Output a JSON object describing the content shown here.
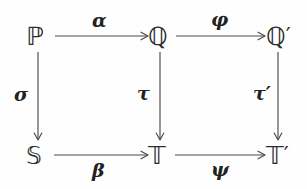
{
  "diagram": {
    "type": "commutative-diagram",
    "grid": {
      "rows": 2,
      "columns": 3
    },
    "background_color": "#fefefe",
    "ink_color": "#2b2b2b",
    "arrow_color": "#4a4a4a",
    "nodes": {
      "top_left": {
        "symbol": "ℙ",
        "prime": "",
        "name": "P",
        "row": 0,
        "col": 0
      },
      "top_middle": {
        "symbol": "ℚ",
        "prime": "",
        "name": "Q",
        "row": 0,
        "col": 1
      },
      "top_right": {
        "symbol": "ℚ",
        "prime": "′",
        "name": "Q-prime",
        "row": 0,
        "col": 2
      },
      "bottom_left": {
        "symbol": "𝕊",
        "prime": "",
        "name": "S",
        "row": 1,
        "col": 0
      },
      "bottom_middle": {
        "symbol": "𝕋",
        "prime": "",
        "name": "T",
        "row": 1,
        "col": 1
      },
      "bottom_right": {
        "symbol": "𝕋",
        "prime": "′",
        "name": "T-prime",
        "row": 1,
        "col": 2
      }
    },
    "arrows": [
      {
        "id": "alpha",
        "label": "α",
        "from": "top_left",
        "to": "top_middle",
        "direction": "right",
        "label_position": "above"
      },
      {
        "id": "phi",
        "label": "φ",
        "from": "top_middle",
        "to": "top_right",
        "direction": "right",
        "label_position": "above"
      },
      {
        "id": "sigma",
        "label": "σ",
        "from": "top_left",
        "to": "bottom_left",
        "direction": "down",
        "label_position": "left"
      },
      {
        "id": "tau",
        "label": "τ",
        "from": "top_middle",
        "to": "bottom_middle",
        "direction": "down",
        "label_position": "left"
      },
      {
        "id": "tau_prime",
        "label": "τ′",
        "from": "top_right",
        "to": "bottom_right",
        "direction": "down",
        "label_position": "left"
      },
      {
        "id": "beta",
        "label": "β",
        "from": "bottom_left",
        "to": "bottom_middle",
        "direction": "right",
        "label_position": "below"
      },
      {
        "id": "psi",
        "label": "ψ",
        "from": "bottom_middle",
        "to": "bottom_right",
        "direction": "right",
        "label_position": "below"
      }
    ]
  }
}
